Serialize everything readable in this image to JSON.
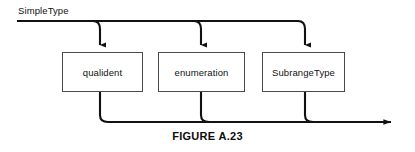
{
  "figure": {
    "caption": "FIGURE A.23",
    "entry_label": "SimpleType"
  },
  "diagram": {
    "type": "railroad-syntax-diagram",
    "nodes": [
      {
        "id": "qualident",
        "label": "qualident"
      },
      {
        "id": "enumeration",
        "label": "enumeration"
      },
      {
        "id": "subrangetype",
        "label": "SubrangeType"
      }
    ],
    "colors": {
      "line": "#111111",
      "box_border": "#4a4a4a",
      "background": "#ffffff",
      "text": "#111111"
    }
  }
}
